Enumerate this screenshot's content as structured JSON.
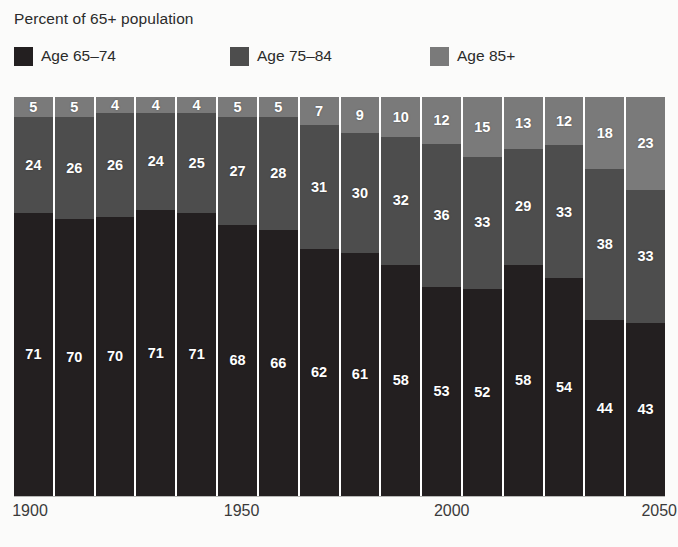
{
  "title": "Percent of 65+ population",
  "colors": {
    "age_65_74": "#231f20",
    "age_75_84": "#4d4d4d",
    "age_85_plus": "#7a7a7a",
    "background": "#fbfbfa",
    "label_text": "#ffffff",
    "axis_text": "#3a3a3a"
  },
  "legend": [
    {
      "label": "Age 65–74",
      "color": "#231f20",
      "key": "age_65_74"
    },
    {
      "label": "Age 75–84",
      "color": "#4d4d4d",
      "key": "age_75_84"
    },
    {
      "label": "Age 85+",
      "color": "#7a7a7a",
      "key": "age_85_plus"
    }
  ],
  "xaxis": {
    "ticks": [
      {
        "label": "1900",
        "left_pct": 1.8
      },
      {
        "label": "1950",
        "left_pct": 33.0
      },
      {
        "label": "2000",
        "left_pct": 64.0
      },
      {
        "label": "2050",
        "left_pct": 94.6
      }
    ]
  },
  "chart_data": {
    "type": "bar",
    "subtype": "stacked-100",
    "title": "Percent of 65+ population",
    "xlabel": "",
    "ylabel": "",
    "ylim": [
      0,
      100
    ],
    "grid": false,
    "legend_position": "top",
    "stack_order_bottom_to_top": [
      "Age 65–74",
      "Age 75–84",
      "Age 85+"
    ],
    "categories": [
      "1900",
      "1910",
      "1920",
      "1930",
      "1940",
      "1950",
      "1960",
      "1970",
      "1980",
      "1990",
      "2000",
      "2010",
      "2020",
      "2030",
      "2040",
      "2050"
    ],
    "tick_labels_shown": [
      "1900",
      "1950",
      "2000",
      "2050"
    ],
    "series": [
      {
        "name": "Age 65–74",
        "color": "#231f20",
        "values": [
          71,
          70,
          70,
          71,
          71,
          68,
          66,
          62,
          61,
          58,
          53,
          52,
          58,
          54,
          44,
          43
        ]
      },
      {
        "name": "Age 75–84",
        "color": "#4d4d4d",
        "values": [
          24,
          26,
          26,
          24,
          25,
          27,
          28,
          31,
          30,
          32,
          36,
          33,
          29,
          33,
          38,
          33
        ]
      },
      {
        "name": "Age 85+",
        "color": "#7a7a7a",
        "values": [
          5,
          5,
          4,
          4,
          4,
          5,
          5,
          7,
          9,
          10,
          12,
          15,
          13,
          12,
          18,
          23
        ]
      }
    ]
  }
}
